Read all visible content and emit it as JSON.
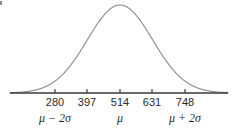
{
  "figure": {
    "title": "",
    "corner_mark": "tick-mark-artifact"
  },
  "axis": {
    "line_color": "#3a3a3a",
    "baseline_y": 93,
    "x_start": 10,
    "x_end": 228
  },
  "curve": {
    "color": "#8a8a8a",
    "stroke_width": 1.1,
    "peak_x": 120,
    "peak_y": 5
  },
  "ticks": [
    {
      "label": "280",
      "x": 55
    },
    {
      "label": "397",
      "x": 87
    },
    {
      "label": "514",
      "x": 120
    },
    {
      "label": "631",
      "x": 152
    },
    {
      "label": "748",
      "x": 185
    }
  ],
  "sigma_labels": [
    {
      "text": "μ − 2σ",
      "x": 55
    },
    {
      "text": "μ",
      "x": 120
    },
    {
      "text": "μ + 2σ",
      "x": 185
    }
  ],
  "chart_data": {
    "type": "line",
    "title": "",
    "xlabel": "",
    "ylabel": "",
    "distribution": "normal",
    "mean": 514,
    "std": 117,
    "x": [
      280,
      397,
      514,
      631,
      748
    ],
    "tick_labels": [
      "280",
      "397",
      "514",
      "631",
      "748"
    ],
    "annotations": [
      "μ − 2σ",
      "μ",
      "μ + 2σ"
    ],
    "grid": false,
    "legend": "none",
    "xlim": [
      163,
      865
    ],
    "ylim": [
      0,
      1
    ]
  }
}
